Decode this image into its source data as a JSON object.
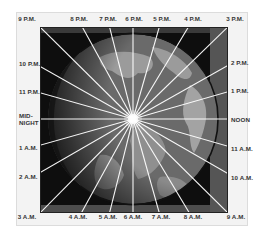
{
  "diagram": {
    "type": "time-zone-globe",
    "colors": {
      "frame": "#f3f3f3",
      "night_side": "#0e0e0e",
      "ocean": "#6a6a6a",
      "land": "#9a9a9a",
      "rays": "#ffffff",
      "globe_edge": "#111111"
    },
    "labels": {
      "top": [
        {
          "text": "9 P.M.",
          "x": 27
        },
        {
          "text": "8 P.M.",
          "x": 79
        },
        {
          "text": "7 P.M.",
          "x": 108
        },
        {
          "text": "6 P.M.",
          "x": 134
        },
        {
          "text": "5 P.M.",
          "x": 162
        },
        {
          "text": "4 P.M.",
          "x": 193
        },
        {
          "text": "3 P.M.",
          "x": 235
        }
      ],
      "right": [
        {
          "text": "2 P.M.",
          "y": 62
        },
        {
          "text": "1 P.M.",
          "y": 90
        },
        {
          "text": "NOON",
          "y": 119
        },
        {
          "text": "11 A.M.",
          "y": 148
        },
        {
          "text": "10 A.M.",
          "y": 177
        }
      ],
      "bottom": [
        {
          "text": "3 A.M.",
          "x": 27
        },
        {
          "text": "4 A.M.",
          "x": 78
        },
        {
          "text": "5 A.M.",
          "x": 108
        },
        {
          "text": "6 A.M.",
          "x": 133
        },
        {
          "text": "7 A.M.",
          "x": 161
        },
        {
          "text": "8 A.M.",
          "x": 193
        },
        {
          "text": "9 A.M.",
          "x": 236
        }
      ],
      "left": [
        {
          "text": "10 P.M.",
          "y": 63
        },
        {
          "text": "11 P.M.",
          "y": 91
        },
        {
          "text": "MID-",
          "y": 115
        },
        {
          "text": "NIGHT",
          "y": 122
        },
        {
          "text": "1 A.M.",
          "y": 147
        },
        {
          "text": "2 A.M.",
          "y": 176
        }
      ]
    }
  }
}
